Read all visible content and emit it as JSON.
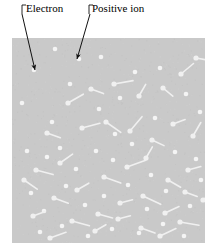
{
  "figure": {
    "kind": "plasma-diagram",
    "width": 218,
    "height": 251,
    "background_color": "#ffffff"
  },
  "box": {
    "name": "ionized-gas-region",
    "x": 12,
    "y": 38,
    "width": 193,
    "height": 205,
    "fill_color": "#c9c9c9"
  },
  "labels": {
    "electron": "Electron",
    "positive_ion": "Positive ion"
  },
  "leaders": [
    {
      "for": "electron",
      "hook_x": 22,
      "hook_y": 5,
      "hook_drop": 9,
      "from_x": 22,
      "from_y": 14,
      "to_x": 35,
      "to_y": 70
    },
    {
      "for": "positive_ion",
      "hook_x": 89,
      "hook_y": 5,
      "hook_drop": 9,
      "from_x": 90,
      "from_y": 14,
      "to_x": 77,
      "to_y": 59
    }
  ],
  "particles": {
    "electron_color": "#f4f4f4",
    "ion_color": "#f0f0f0",
    "electron_radius": 2.3,
    "ion_bulb_radius": 2.6,
    "ion_tail_width": 1.6,
    "electron_count": 42,
    "ion_count": 38,
    "electrons": [
      [
        34,
        70
      ],
      [
        55,
        49
      ],
      [
        79,
        59
      ],
      [
        101,
        57
      ],
      [
        135,
        72
      ],
      [
        160,
        68
      ],
      [
        22,
        103
      ],
      [
        52,
        122
      ],
      [
        99,
        109
      ],
      [
        120,
        98
      ],
      [
        186,
        94
      ],
      [
        200,
        112
      ],
      [
        27,
        151
      ],
      [
        47,
        157
      ],
      [
        60,
        148
      ],
      [
        76,
        169
      ],
      [
        96,
        151
      ],
      [
        113,
        160
      ],
      [
        132,
        144
      ],
      [
        151,
        175
      ],
      [
        175,
        152
      ],
      [
        196,
        159
      ],
      [
        31,
        193
      ],
      [
        44,
        211
      ],
      [
        66,
        186
      ],
      [
        85,
        205
      ],
      [
        104,
        196
      ],
      [
        128,
        185
      ],
      [
        147,
        209
      ],
      [
        166,
        191
      ],
      [
        190,
        206
      ],
      [
        40,
        232
      ],
      [
        62,
        226
      ],
      [
        88,
        236
      ],
      [
        112,
        229
      ],
      [
        139,
        233
      ],
      [
        163,
        224
      ],
      [
        184,
        236
      ],
      [
        70,
        84
      ],
      [
        115,
        134
      ],
      [
        155,
        118
      ],
      [
        201,
        180
      ]
    ],
    "ions": [
      [
        68,
        103,
        330
      ],
      [
        91,
        89,
        20
      ],
      [
        114,
        84,
        350
      ],
      [
        139,
        96,
        300
      ],
      [
        163,
        88,
        40
      ],
      [
        181,
        74,
        320
      ],
      [
        196,
        58,
        10
      ],
      [
        47,
        133,
        20
      ],
      [
        82,
        128,
        345
      ],
      [
        106,
        122,
        35
      ],
      [
        130,
        131,
        310
      ],
      [
        152,
        140,
        25
      ],
      [
        173,
        124,
        340
      ],
      [
        193,
        136,
        300
      ],
      [
        36,
        170,
        15
      ],
      [
        60,
        163,
        325
      ],
      [
        104,
        177,
        20
      ],
      [
        127,
        167,
        340
      ],
      [
        146,
        158,
        300
      ],
      [
        168,
        180,
        30
      ],
      [
        188,
        170,
        345
      ],
      [
        24,
        180,
        35
      ],
      [
        54,
        198,
        20
      ],
      [
        77,
        190,
        330
      ],
      [
        98,
        214,
        15
      ],
      [
        120,
        203,
        345
      ],
      [
        143,
        196,
        25
      ],
      [
        165,
        213,
        335
      ],
      [
        185,
        192,
        20
      ],
      [
        33,
        216,
        340
      ],
      [
        72,
        221,
        15
      ],
      [
        95,
        231,
        330
      ],
      [
        118,
        219,
        345
      ],
      [
        141,
        228,
        20
      ],
      [
        160,
        236,
        335
      ],
      [
        180,
        222,
        10
      ],
      [
        50,
        238,
        340
      ],
      [
        203,
        200,
        320
      ]
    ]
  }
}
